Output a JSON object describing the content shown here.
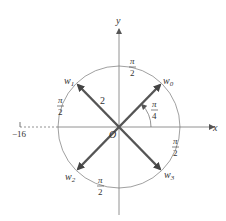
{
  "diagram": {
    "axes": {
      "x_label": "x",
      "y_label": "y",
      "origin_label": "O"
    },
    "tick": {
      "label": "−16",
      "value": -16
    },
    "vectors": [
      {
        "name": "w0",
        "base": "w",
        "sub": "0",
        "angle_deg": 45
      },
      {
        "name": "w1",
        "base": "w",
        "sub": "1",
        "angle_deg": 135
      },
      {
        "name": "w2",
        "base": "w",
        "sub": "2",
        "angle_deg": 225
      },
      {
        "name": "w3",
        "base": "w",
        "sub": "3",
        "angle_deg": 315
      }
    ],
    "magnitude_label": "2",
    "angle_labels": {
      "initial": {
        "num": "π",
        "den": "4"
      },
      "top": {
        "num": "π",
        "den": "2"
      },
      "left": {
        "num": "π",
        "den": "2"
      },
      "bottom": {
        "num": "π",
        "den": "2"
      },
      "right": {
        "num": "π",
        "den": "2"
      }
    },
    "colors": {
      "vector": "#555555",
      "axis": "#777777",
      "circle": "#888888"
    }
  }
}
